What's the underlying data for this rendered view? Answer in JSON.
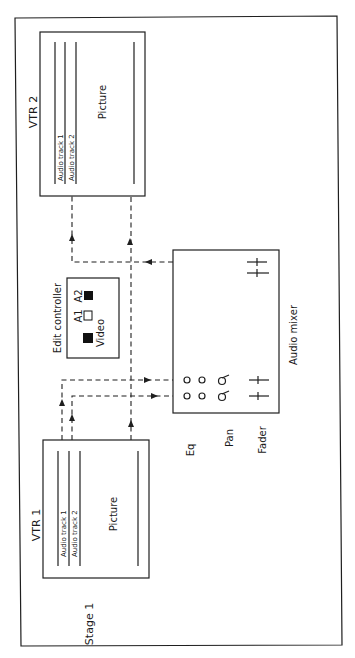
{
  "diagram": {
    "stage_label": "Stage 1",
    "vtr1": {
      "title": "VTR 1",
      "track1": "Audio track 1",
      "track2": "Audio track 2",
      "picture": "Picture"
    },
    "vtr2": {
      "title": "VTR 2",
      "track1": "Audio track 1",
      "track2": "Audio track 2",
      "picture": "Picture"
    },
    "edit_controller": {
      "title": "Edit controller",
      "a1": "A1",
      "a2": "A2",
      "video": "Video",
      "buttons": [
        {
          "name": "video",
          "state": "filled"
        },
        {
          "name": "A1",
          "state": "empty"
        },
        {
          "name": "A2",
          "state": "filled"
        }
      ]
    },
    "audio_mixer": {
      "title": "Audio mixer",
      "eq_label": "Eq",
      "pan_label": "Pan",
      "fader_label": "Fader",
      "channels": 2
    },
    "colors": {
      "line": "#1f1f1f",
      "background": "#ffffff"
    }
  }
}
